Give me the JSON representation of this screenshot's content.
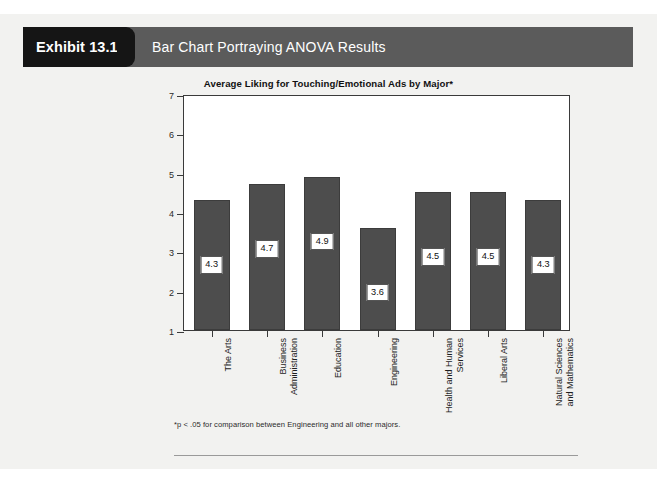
{
  "header": {
    "exhibit_label": "Exhibit 13.16",
    "title": "Bar Chart Portraying ANOVA Results",
    "tab_color": "#151515",
    "bar_color": "#5b5b5b",
    "text_color": "#ffffff"
  },
  "footnote": "*p < .05 for comparison between Engineering and all other majors.",
  "chart_data": {
    "type": "bar",
    "title": "Average Liking for Touching/Emotional Ads by Major*",
    "xlabel": "",
    "ylabel": "",
    "ylim": [
      1,
      7
    ],
    "yticks": [
      1,
      2,
      3,
      4,
      5,
      6,
      7
    ],
    "ytick_labels": [
      "1",
      "2",
      "3",
      "4",
      "5",
      "6",
      "7"
    ],
    "grid": false,
    "legend": "none",
    "bar_color": "#4d4d4d",
    "categories": [
      "The Arts",
      "Business\nAdministration",
      "Education",
      "Engineering",
      "Health and Human\nServices",
      "Liberal Arts",
      "Natural Sciences\nand Mathematics"
    ],
    "values": [
      4.3,
      4.7,
      4.9,
      3.6,
      4.5,
      4.5,
      4.3
    ],
    "data_labels": [
      "4.3",
      "4.7",
      "4.9",
      "3.6",
      "4.5",
      "4.5",
      "4.3"
    ]
  }
}
